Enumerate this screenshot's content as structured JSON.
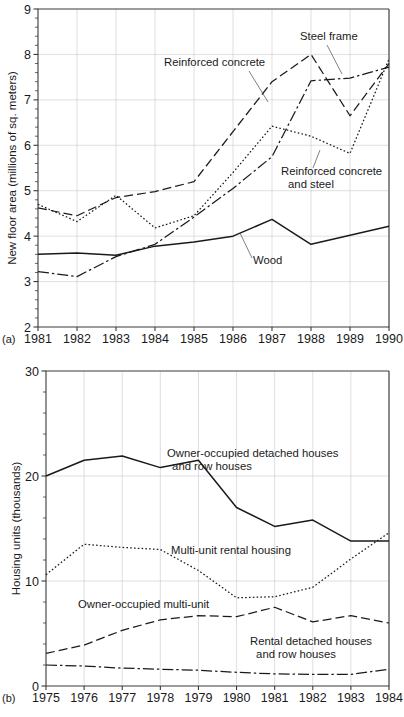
{
  "figure_a": {
    "panel_label": "(a)",
    "ylabel": "New floor area (millions of sq. meters)",
    "yticks": [
      "2",
      "3",
      "4",
      "5",
      "6",
      "7",
      "8",
      "9"
    ],
    "xticks": [
      "1981",
      "1982",
      "1983",
      "1984",
      "1985",
      "1986",
      "1987",
      "1988",
      "1989",
      "1990"
    ],
    "labels": {
      "reinforced_concrete": "Reinforced concrete",
      "steel_frame": "Steel frame",
      "reinforced_concrete_and_steel_line1": "Reinforced concrete",
      "reinforced_concrete_and_steel_line2": "and steel",
      "wood": "Wood"
    }
  },
  "figure_b": {
    "panel_label": "(b)",
    "ylabel": "Housing units (thousands)",
    "yticks": [
      "0",
      "10",
      "20",
      "30"
    ],
    "xticks": [
      "1975",
      "1976",
      "1977",
      "1978",
      "1979",
      "1980",
      "1981",
      "1982",
      "1983",
      "1984"
    ],
    "labels": {
      "owner_detached_line1": "Owner-occupied detached houses",
      "owner_detached_line2": "and row houses",
      "multi_unit_rental": "Multi-unit rental housing",
      "owner_multi_unit": "Owner-occupied multi-unit",
      "rental_detached_line1": "Rental detached houses",
      "rental_detached_line2": "and row houses"
    }
  },
  "chart_data": [
    {
      "type": "line",
      "id": "a",
      "title": "",
      "xlabel": "",
      "ylabel": "New floor area (millions of sq. meters)",
      "x": [
        1981,
        1982,
        1983,
        1984,
        1985,
        1986,
        1987,
        1988,
        1989,
        1990
      ],
      "xlim": [
        1981,
        1990
      ],
      "ylim": [
        2,
        9
      ],
      "ytick_step": 1,
      "yminor_step": 0.2,
      "grid": true,
      "legend": "inline-annotations",
      "series": [
        {
          "name": "Reinforced concrete",
          "linestyle": "dashed",
          "values": [
            4.62,
            4.45,
            4.85,
            4.98,
            5.2,
            6.3,
            7.4,
            8.0,
            6.65,
            7.8
          ]
        },
        {
          "name": "Steel frame",
          "linestyle": "dashdot",
          "values": [
            3.22,
            3.11,
            3.55,
            3.82,
            4.42,
            5.05,
            5.75,
            7.42,
            7.48,
            7.72
          ]
        },
        {
          "name": "Reinforced concrete and steel",
          "linestyle": "dotted",
          "values": [
            4.7,
            4.32,
            4.9,
            4.18,
            4.45,
            5.4,
            6.42,
            6.2,
            5.82,
            7.9
          ]
        },
        {
          "name": "Wood",
          "linestyle": "solid",
          "values": [
            3.6,
            3.63,
            3.58,
            3.78,
            3.87,
            4.0,
            4.37,
            3.82,
            4.02,
            4.22
          ]
        }
      ]
    },
    {
      "type": "line",
      "id": "b",
      "title": "",
      "xlabel": "",
      "ylabel": "Housing units (thousands)",
      "x": [
        1975,
        1976,
        1977,
        1978,
        1979,
        1980,
        1981,
        1982,
        1983,
        1984
      ],
      "xlim": [
        1975,
        1984
      ],
      "ylim": [
        0,
        30
      ],
      "ytick_step": 10,
      "yminor_step": 2,
      "grid": true,
      "legend": "inline-annotations",
      "series": [
        {
          "name": "Owner-occupied detached houses and row houses",
          "linestyle": "solid",
          "values": [
            20.0,
            21.5,
            21.9,
            20.8,
            21.5,
            17.0,
            15.2,
            15.8,
            13.8,
            13.8
          ]
        },
        {
          "name": "Multi-unit rental housing",
          "linestyle": "dotted",
          "values": [
            10.6,
            13.5,
            13.2,
            13.0,
            11.0,
            8.4,
            8.5,
            9.4,
            12.1,
            14.6
          ]
        },
        {
          "name": "Owner-occupied multi-unit",
          "linestyle": "dashed",
          "values": [
            3.1,
            3.9,
            5.3,
            6.3,
            6.7,
            6.6,
            7.5,
            6.1,
            6.7,
            6.0
          ]
        },
        {
          "name": "Rental detached houses and row houses",
          "linestyle": "dashdot",
          "values": [
            2.0,
            1.9,
            1.7,
            1.6,
            1.5,
            1.3,
            1.15,
            1.1,
            1.1,
            1.6
          ]
        }
      ]
    }
  ]
}
